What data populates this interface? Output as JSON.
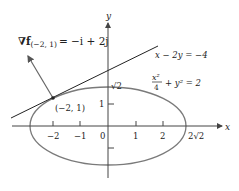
{
  "figure": {
    "gradient_label_prefix": "∇f",
    "gradient_label_sub": "(−2, 1)",
    "gradient_label_value": "= −i + 2j",
    "line_label": "x − 2y = −4",
    "ellipse_label_num": "x²",
    "ellipse_label_den": "4",
    "ellipse_label_rest": "+ y² = 2",
    "point_label": "(−2, 1)",
    "y_axis_label": "y",
    "x_axis_label": "x",
    "y_tick_sqrt2": "√2",
    "y_tick_1": "1",
    "x_ticks": [
      "−2",
      "−1",
      "0",
      "1",
      "2",
      "2√2"
    ],
    "colors": {
      "ellipse": "#7a7a7a",
      "axes": "#444444",
      "line": "#222222",
      "arrow": "#666666"
    }
  }
}
